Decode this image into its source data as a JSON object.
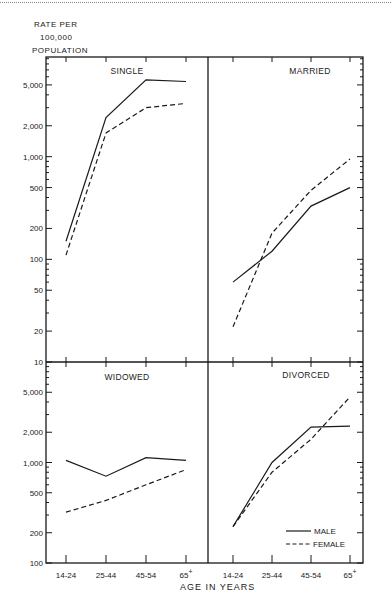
{
  "page": {
    "y_axis_label_line1": "RATE  PER",
    "y_axis_label_line2": "100,000",
    "y_axis_label_line3": "POPULATION",
    "x_axis_label": "AGE  IN  YEARS"
  },
  "legend": {
    "male": "MALE",
    "female": "FEMALE"
  },
  "colors": {
    "line": "#1a1a1a",
    "frame": "#1a1a1a",
    "background": "#ffffff"
  },
  "chart_data": [
    {
      "type": "line",
      "title": "SINGLE",
      "xlabel": "AGE IN YEARS",
      "ylabel": "RATE PER 100,000 POPULATION",
      "yscale": "log",
      "ylim": [
        10,
        10000
      ],
      "yticks": [
        "10",
        "20",
        "50",
        "100",
        "200",
        "500",
        "1,000",
        "2,000",
        "5,000"
      ],
      "categories": [
        "14-24",
        "25-44",
        "45-54",
        "65+"
      ],
      "series": [
        {
          "name": "MALE",
          "style": "solid",
          "values": [
            150,
            2400,
            5600,
            5400
          ]
        },
        {
          "name": "FEMALE",
          "style": "dashed",
          "values": [
            110,
            1700,
            3000,
            3300
          ]
        }
      ]
    },
    {
      "type": "line",
      "title": "MARRIED",
      "xlabel": "AGE IN YEARS",
      "ylabel": "RATE PER 100,000 POPULATION",
      "yscale": "log",
      "ylim": [
        10,
        10000
      ],
      "categories": [
        "14-24",
        "25-44",
        "45-54",
        "65+"
      ],
      "series": [
        {
          "name": "MALE",
          "style": "solid",
          "values": [
            60,
            120,
            330,
            500
          ]
        },
        {
          "name": "FEMALE",
          "style": "dashed",
          "values": [
            22,
            180,
            470,
            950
          ]
        }
      ]
    },
    {
      "type": "line",
      "title": "WIDOWED",
      "xlabel": "AGE IN YEARS",
      "ylabel": "RATE PER 100,000 POPULATION",
      "yscale": "log",
      "ylim": [
        100,
        10000
      ],
      "yticks": [
        "100",
        "200",
        "500",
        "1,000",
        "2,000",
        "5,000"
      ],
      "categories": [
        "14-24",
        "25-44",
        "45-54",
        "65+"
      ],
      "series": [
        {
          "name": "MALE",
          "style": "solid",
          "values": [
            1050,
            730,
            1120,
            1050
          ]
        },
        {
          "name": "FEMALE",
          "style": "dashed",
          "values": [
            320,
            420,
            600,
            850
          ]
        }
      ]
    },
    {
      "type": "line",
      "title": "DIVORCED",
      "xlabel": "AGE IN YEARS",
      "ylabel": "RATE PER 100,000 POPULATION",
      "yscale": "log",
      "ylim": [
        100,
        10000
      ],
      "categories": [
        "14-24",
        "25-44",
        "45-54",
        "65+"
      ],
      "legend": [
        "MALE",
        "FEMALE"
      ],
      "legend_position": "lower right",
      "series": [
        {
          "name": "MALE",
          "style": "solid",
          "values": [
            230,
            1000,
            2250,
            2300
          ]
        },
        {
          "name": "FEMALE",
          "style": "dashed",
          "values": [
            230,
            800,
            1700,
            4500
          ]
        }
      ]
    }
  ]
}
